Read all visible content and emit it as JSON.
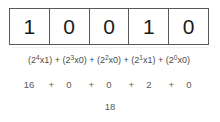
{
  "diagram": {
    "bits": [
      {
        "digit": "1",
        "position": 4
      },
      {
        "digit": "0",
        "position": 3
      },
      {
        "digit": "0",
        "position": 2
      },
      {
        "digit": "1",
        "position": 1
      },
      {
        "digit": "0",
        "position": 0
      }
    ],
    "expression": {
      "terms": [
        {
          "open": "(2",
          "exponent": "4",
          "multiplier": "x1",
          "close": ")"
        },
        {
          "open": "(2",
          "exponent": "3",
          "multiplier": "x0",
          "close": ")"
        },
        {
          "open": "(2",
          "exponent": "2",
          "multiplier": "x0",
          "close": ")"
        },
        {
          "open": "(2",
          "exponent": "1",
          "multiplier": "x1",
          "close": ")"
        },
        {
          "open": "(2",
          "exponent": "0",
          "multiplier": "x0",
          "close": ")"
        }
      ],
      "operator": "+",
      "full_text": "(2^4x1) + (2^3x0) + (2^2x0) + (2^1x1) + (2^0x0)"
    },
    "sum_terms": {
      "values": [
        "16",
        "0",
        "0",
        "2",
        "0"
      ],
      "operator": "+",
      "full_text": "16 + 0 + 0 + 2 + 0"
    },
    "total": "18",
    "colors": {
      "box_border": "#595959",
      "digit_text": "#1a1a1a",
      "expression_text": "#4a4a4a",
      "sum_text": "#5a5a5a",
      "background": "#ffffff"
    }
  }
}
